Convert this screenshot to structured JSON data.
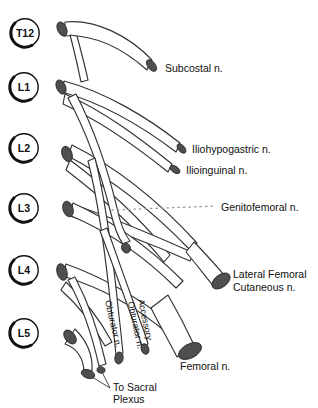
{
  "figure": {
    "roots": [
      {
        "label": "T12"
      },
      {
        "label": "L1"
      },
      {
        "label": "L2"
      },
      {
        "label": "L3"
      },
      {
        "label": "L4"
      },
      {
        "label": "L5"
      }
    ],
    "labels": {
      "subcostal": "Subcostal n.",
      "iliohypogastric": "Iliohypogastric n.",
      "ilioinguinal": "Ilioinguinal n.",
      "genitofemoral": "Genitofemoral n.",
      "lateral_femoral_1": "Lateral Femoral",
      "lateral_femoral_2": "Cutaneous n.",
      "femoral": "Femoral n.",
      "obturator": "Obturator n.",
      "accessory_obturator_1": "Accessory",
      "accessory_obturator_2": "Obturator n.",
      "sacral_1": "To Sacral",
      "sacral_2": "Plexus"
    },
    "colors": {
      "outline": "#333333",
      "end_cap": "#4f4f4f",
      "text": "#111111",
      "dotted_leader": "#9a9a9a",
      "background": "#ffffff"
    }
  }
}
